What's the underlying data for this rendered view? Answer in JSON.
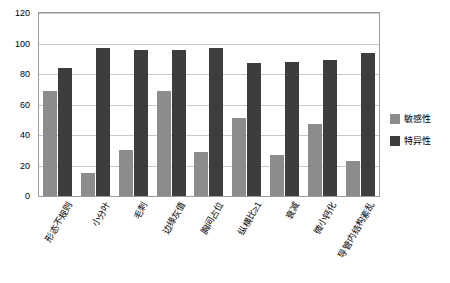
{
  "chart_data": {
    "type": "bar",
    "title": "",
    "xlabel": "",
    "ylabel": "",
    "ylim": [
      0,
      120
    ],
    "yticks": [
      0,
      20,
      40,
      60,
      80,
      100,
      120
    ],
    "grid": "horizontal",
    "legend_position": "right",
    "categories": [
      "形态不规则",
      "小分叶",
      "毛刺",
      "边缘灰值",
      "胸间占位",
      "纵横比≥1",
      "衰减",
      "微小钙化",
      "导管内结构紊乱"
    ],
    "series": [
      {
        "name": "敏感性",
        "color": "#8c8c8c",
        "values": [
          69,
          15,
          30,
          69,
          29,
          51,
          27,
          47,
          23
        ]
      },
      {
        "name": "特异性",
        "color": "#3d3d3d",
        "values": [
          84,
          97,
          96,
          96,
          97,
          87,
          88,
          89,
          94
        ]
      }
    ]
  },
  "legend": {
    "items": [
      {
        "label": "敏感性",
        "color": "#8c8c8c"
      },
      {
        "label": "特异性",
        "color": "#3d3d3d"
      }
    ]
  },
  "axis": {
    "y_tick_labels": [
      "0",
      "20",
      "40",
      "60",
      "80",
      "100",
      "120"
    ]
  }
}
